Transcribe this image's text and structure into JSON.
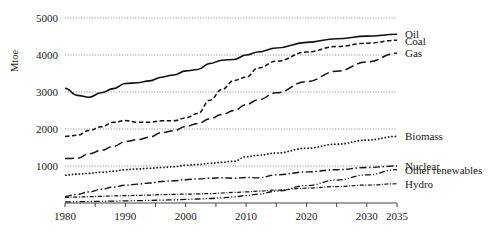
{
  "chart_data": {
    "type": "line",
    "title": "",
    "xlabel": "",
    "ylabel": "Mtoe",
    "xlim": [
      1980,
      2035
    ],
    "ylim": [
      0,
      5000
    ],
    "grid": true,
    "legend_position": "right-inline-labels",
    "y_ticks": [
      1000,
      2000,
      3000,
      4000,
      5000
    ],
    "y_tick_labels": [
      "1000",
      "2000",
      "3000",
      "4000",
      "5000"
    ],
    "x_ticks": [
      1980,
      1985,
      1990,
      1995,
      2000,
      2005,
      2010,
      2015,
      2020,
      2025,
      2030,
      2035
    ],
    "x_tick_labels": [
      "1980",
      "",
      "1990",
      "",
      "2000",
      "",
      "2010",
      "",
      "2020",
      "",
      "2030",
      "2035"
    ],
    "x_labeled_ticks": [
      {
        "year": 1980,
        "label": "1980"
      },
      {
        "year": 1990,
        "label": "1990"
      },
      {
        "year": 2000,
        "label": "2000"
      },
      {
        "year": 2010,
        "label": "2010"
      },
      {
        "year": 2020,
        "label": "2020"
      },
      {
        "year": 2030,
        "label": "2030"
      },
      {
        "year": 2035,
        "label": "2035"
      }
    ],
    "x": [
      1980,
      1982,
      1984,
      1986,
      1988,
      1990,
      1992,
      1994,
      1996,
      1998,
      2000,
      2002,
      2004,
      2006,
      2008,
      2010,
      2012,
      2015,
      2020,
      2025,
      2030,
      2035
    ],
    "series": [
      {
        "name": "Oil",
        "label": "Oil",
        "style": "solid",
        "dasharray": "none",
        "width": 1.6,
        "label_y_value": 4560,
        "values": [
          3100,
          2910,
          2860,
          2980,
          3090,
          3230,
          3250,
          3300,
          3400,
          3460,
          3570,
          3610,
          3770,
          3860,
          3880,
          4000,
          4080,
          4190,
          4340,
          4440,
          4510,
          4560
        ]
      },
      {
        "name": "Coal",
        "label": "Coal",
        "style": "short-dash",
        "dasharray": "4.5 2.5",
        "width": 1.5,
        "label_y_value": 4390,
        "values": [
          1800,
          1830,
          1960,
          2060,
          2180,
          2230,
          2180,
          2180,
          2220,
          2220,
          2300,
          2420,
          2780,
          3070,
          3310,
          3400,
          3650,
          3830,
          4080,
          4230,
          4320,
          4400
        ]
      },
      {
        "name": "Gas",
        "label": "Gas",
        "style": "long-dash",
        "dasharray": "9 4",
        "width": 1.5,
        "label_y_value": 4050,
        "values": [
          1200,
          1210,
          1330,
          1420,
          1530,
          1660,
          1710,
          1780,
          1900,
          1950,
          2070,
          2150,
          2280,
          2390,
          2500,
          2660,
          2790,
          2980,
          3280,
          3560,
          3810,
          4050
        ]
      },
      {
        "name": "Biomass",
        "label": "Biomass",
        "style": "dotted",
        "dasharray": "1.6 1.8",
        "width": 1.6,
        "label_y_value": 1800,
        "values": [
          750,
          780,
          800,
          830,
          860,
          900,
          920,
          940,
          960,
          980,
          1020,
          1040,
          1070,
          1100,
          1130,
          1250,
          1290,
          1350,
          1480,
          1590,
          1700,
          1800
        ]
      },
      {
        "name": "Nuclear",
        "label": "Nuclear",
        "style": "dash-dot",
        "dasharray": "7 2.5 1.5 2.5",
        "width": 1.4,
        "label_y_value": 1000,
        "values": [
          180,
          230,
          300,
          370,
          430,
          480,
          510,
          540,
          580,
          600,
          630,
          650,
          670,
          680,
          670,
          690,
          680,
          760,
          840,
          900,
          960,
          1000
        ]
      },
      {
        "name": "Other renewables",
        "label": "Other renewables",
        "style": "dash-dot-dot",
        "dasharray": "6 2 1.2 2 1.2 2",
        "width": 1.3,
        "label_y_value": 900,
        "values": [
          30,
          35,
          40,
          45,
          52,
          58,
          64,
          70,
          78,
          86,
          96,
          108,
          122,
          140,
          165,
          200,
          240,
          320,
          470,
          620,
          760,
          900
        ]
      },
      {
        "name": "Hydro",
        "label": "Hydro",
        "style": "fine-dash-dot",
        "dasharray": "4 1.6 1 1.6",
        "width": 1.2,
        "label_y_value": 520,
        "values": [
          150,
          160,
          170,
          180,
          190,
          200,
          205,
          215,
          225,
          235,
          240,
          245,
          255,
          270,
          285,
          300,
          320,
          350,
          400,
          445,
          485,
          520
        ]
      }
    ]
  }
}
